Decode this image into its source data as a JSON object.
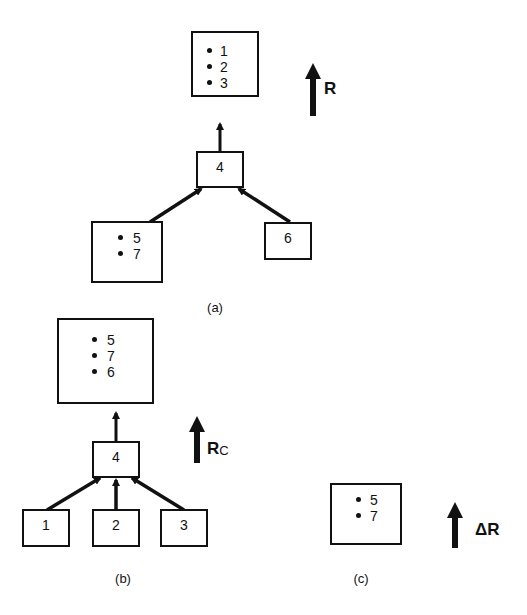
{
  "figure": {
    "panel_a": {
      "label": "(a)",
      "result_box": {
        "items": [
          "1",
          "2",
          "3"
        ]
      },
      "join_node": {
        "label": "4"
      },
      "left_input": {
        "items": [
          "5",
          "7"
        ]
      },
      "right_input": {
        "label": "6"
      },
      "flow_label": "R"
    },
    "panel_b": {
      "label": "(b)",
      "result_box": {
        "items": [
          "5",
          "7",
          "6"
        ]
      },
      "join_node": {
        "label": "4"
      },
      "inputs": [
        {
          "label": "1"
        },
        {
          "label": "2"
        },
        {
          "label": "3"
        }
      ],
      "flow_label_main": "R",
      "flow_label_sub": "C"
    },
    "panel_c": {
      "label": "(c)",
      "box": {
        "items": [
          "5",
          "7"
        ]
      },
      "flow_label": "ΔR"
    }
  }
}
